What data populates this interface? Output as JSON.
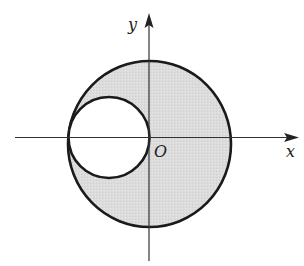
{
  "diagram": {
    "type": "coordinate-plane-circles",
    "axes": {
      "x_label": "x",
      "y_label": "y",
      "origin_label": "O"
    },
    "shapes": [
      {
        "name": "large-circle",
        "description": "Large circle centered near origin, shaded gray",
        "fill": "#dcdcdc",
        "stroke": "#1a1a1a"
      },
      {
        "name": "small-circle",
        "description": "Small circle tangent to y-axis at O and internally tangent to large circle at left, unshaded (white)",
        "fill": "#ffffff",
        "stroke": "#1a1a1a"
      }
    ],
    "colors": {
      "shade": "#dcdcdc",
      "stroke": "#1a1a1a",
      "background": "#ffffff"
    }
  }
}
